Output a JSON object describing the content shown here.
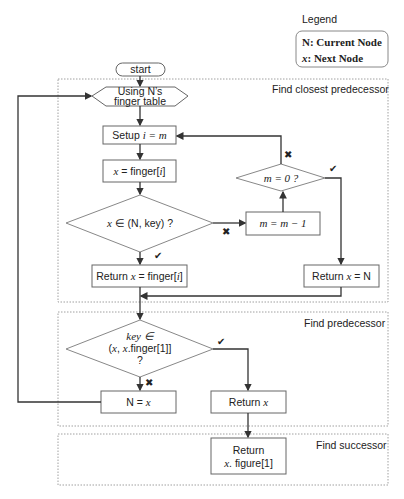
{
  "legend": {
    "title": "Legend",
    "items": [
      {
        "symbol": "N",
        "desc": ": Current Node"
      },
      {
        "symbol": "x",
        "desc": ": Next Node"
      }
    ]
  },
  "groups": {
    "closest": "Find closest predecessor",
    "predecessor": "Find predecessor",
    "successor": "Find successor"
  },
  "nodes": {
    "start": "start",
    "using_1": "Using N’s",
    "using_2": "finger table",
    "setup_pre": "Setup ",
    "setup_math": "i = m",
    "x_finger_math": "x",
    "x_finger_rest": " = finger[",
    "x_finger_i": "i",
    "x_finger_end": "]",
    "cond1_x": "x",
    "cond1_rest": " ∈ (N, key) ?",
    "m_dec": "m = m − 1",
    "m_zero": "m = 0 ?",
    "ret_finger_pre": "Return ",
    "ret_finger_x": "x",
    "ret_finger_rest": " = finger[",
    "ret_finger_i": "i",
    "ret_finger_end": "]",
    "ret_n_pre": "Return ",
    "ret_n_x": "x",
    "ret_n_rest": " = N",
    "cond2_line1": "key ∈",
    "cond2_line2_a": "(",
    "cond2_line2_x1": "x",
    "cond2_line2_b": ", ",
    "cond2_line2_x2": "x",
    "cond2_line2_c": ".finger[1]]",
    "cond2_line3": "?",
    "n_eq_x_pre": "N = ",
    "n_eq_x_x": "x",
    "ret_x_pre": "Return ",
    "ret_x_x": "x",
    "ret_fig_line1": "Return",
    "ret_fig_x": "x",
    "ret_fig_rest": ". figure[1]"
  },
  "marks": {
    "yes": "✔",
    "no": "✖"
  }
}
